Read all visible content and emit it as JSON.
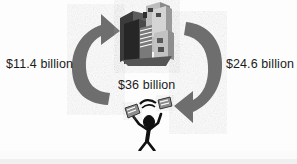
{
  "diagram": {
    "background_color": "#fdfdfd",
    "arrow_color": "#6e6e6e",
    "text_color": "#1b1b1b",
    "figure_color": "#111111",
    "labels": {
      "left": "$11.4 billion",
      "center": "$36 billion",
      "right": "$24.6 billion"
    },
    "nodes": {
      "top": "city-buildings",
      "bottom": "person-with-money"
    },
    "arrows": [
      {
        "name": "left-arrow-up",
        "direction": "upward",
        "side": "left"
      },
      {
        "name": "right-arrow-down",
        "direction": "downward",
        "side": "right"
      }
    ]
  }
}
